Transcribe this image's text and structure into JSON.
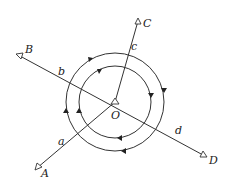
{
  "diagram": {
    "type": "geometry",
    "center": {
      "label": "O",
      "x": 115,
      "y": 102
    },
    "circles": [
      {
        "name": "outer",
        "r": 49,
        "direction": "clockwise"
      },
      {
        "name": "inner",
        "r": 36,
        "direction": "clockwise"
      }
    ],
    "rays": [
      {
        "end_label": "A",
        "mid_label": "a",
        "x2": 37,
        "y2": 168
      },
      {
        "end_label": "B",
        "mid_label": "b",
        "x2": 17,
        "y2": 55
      },
      {
        "end_label": "C",
        "mid_label": "c",
        "x2": 138,
        "y2": 20
      },
      {
        "end_label": "D",
        "mid_label": "d",
        "x2": 205,
        "y2": 156
      }
    ],
    "labels": {
      "O": "O",
      "A": "A",
      "B": "B",
      "C": "C",
      "D": "D",
      "a": "a",
      "b": "b",
      "c": "c",
      "d": "d"
    },
    "colors": {
      "line": "#333333",
      "background": "#ffffff"
    }
  }
}
